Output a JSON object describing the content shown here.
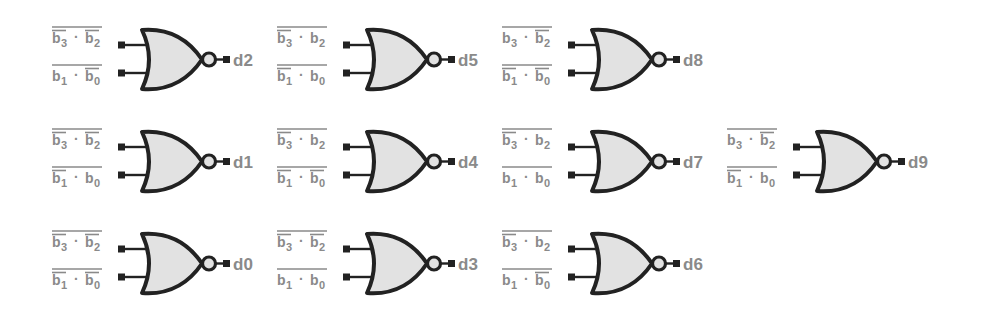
{
  "diagram": {
    "title": "",
    "colors": {
      "label": "#8a8a8a",
      "gate_fill": "#e2e2e2",
      "gate_stroke": "#222222",
      "background": "#ffffff"
    },
    "gates": [
      {
        "output": "d2",
        "row": 0,
        "col": 0,
        "x": 118,
        "y": 18,
        "term1": {
          "left": "b3",
          "left_sub": "3",
          "right": "b2",
          "right_sub": "2",
          "left_bar": true,
          "right_bar": true,
          "outer_bar": true
        },
        "term2": {
          "left": "b1",
          "left_sub": "1",
          "right": "b0",
          "right_sub": "0",
          "left_bar": false,
          "right_bar": true,
          "outer_bar": true
        }
      },
      {
        "output": "d5",
        "row": 0,
        "col": 1,
        "x": 343,
        "y": 18,
        "term1": {
          "left": "b3",
          "left_sub": "3",
          "right": "b2",
          "right_sub": "2",
          "left_bar": true,
          "right_bar": false,
          "outer_bar": true
        },
        "term2": {
          "left": "b1",
          "left_sub": "1",
          "right": "b0",
          "right_sub": "0",
          "left_bar": true,
          "right_bar": false,
          "outer_bar": true
        }
      },
      {
        "output": "d8",
        "row": 0,
        "col": 2,
        "x": 568,
        "y": 18,
        "term1": {
          "left": "b3",
          "left_sub": "3",
          "right": "b2",
          "right_sub": "2",
          "left_bar": false,
          "right_bar": true,
          "outer_bar": true
        },
        "term2": {
          "left": "b1",
          "left_sub": "1",
          "right": "b0",
          "right_sub": "0",
          "left_bar": true,
          "right_bar": true,
          "outer_bar": true
        }
      },
      {
        "output": "d1",
        "row": 1,
        "col": 0,
        "x": 118,
        "y": 120,
        "term1": {
          "left": "b3",
          "left_sub": "3",
          "right": "b2",
          "right_sub": "2",
          "left_bar": true,
          "right_bar": true,
          "outer_bar": true
        },
        "term2": {
          "left": "b1",
          "left_sub": "1",
          "right": "b0",
          "right_sub": "0",
          "left_bar": true,
          "right_bar": false,
          "outer_bar": true
        }
      },
      {
        "output": "d4",
        "row": 1,
        "col": 1,
        "x": 343,
        "y": 120,
        "term1": {
          "left": "b3",
          "left_sub": "3",
          "right": "b2",
          "right_sub": "2",
          "left_bar": true,
          "right_bar": false,
          "outer_bar": true
        },
        "term2": {
          "left": "b1",
          "left_sub": "1",
          "right": "b0",
          "right_sub": "0",
          "left_bar": true,
          "right_bar": true,
          "outer_bar": true
        }
      },
      {
        "output": "d7",
        "row": 1,
        "col": 2,
        "x": 568,
        "y": 120,
        "term1": {
          "left": "b3",
          "left_sub": "3",
          "right": "b2",
          "right_sub": "2",
          "left_bar": true,
          "right_bar": false,
          "outer_bar": true
        },
        "term2": {
          "left": "b1",
          "left_sub": "1",
          "right": "b0",
          "right_sub": "0",
          "left_bar": false,
          "right_bar": false,
          "outer_bar": true
        }
      },
      {
        "output": "d9",
        "row": 1,
        "col": 3,
        "x": 793,
        "y": 120,
        "term1": {
          "left": "b3",
          "left_sub": "3",
          "right": "b2",
          "right_sub": "2",
          "left_bar": false,
          "right_bar": true,
          "outer_bar": true
        },
        "term2": {
          "left": "b1",
          "left_sub": "1",
          "right": "b0",
          "right_sub": "0",
          "left_bar": true,
          "right_bar": false,
          "outer_bar": true
        }
      },
      {
        "output": "d0",
        "row": 2,
        "col": 0,
        "x": 118,
        "y": 222,
        "term1": {
          "left": "b3",
          "left_sub": "3",
          "right": "b2",
          "right_sub": "2",
          "left_bar": true,
          "right_bar": true,
          "outer_bar": true
        },
        "term2": {
          "left": "b1",
          "left_sub": "1",
          "right": "b0",
          "right_sub": "0",
          "left_bar": true,
          "right_bar": true,
          "outer_bar": true
        }
      },
      {
        "output": "d3",
        "row": 2,
        "col": 1,
        "x": 343,
        "y": 222,
        "term1": {
          "left": "b3",
          "left_sub": "3",
          "right": "b2",
          "right_sub": "2",
          "left_bar": true,
          "right_bar": true,
          "outer_bar": true
        },
        "term2": {
          "left": "b1",
          "left_sub": "1",
          "right": "b0",
          "right_sub": "0",
          "left_bar": false,
          "right_bar": false,
          "outer_bar": true
        }
      },
      {
        "output": "d6",
        "row": 2,
        "col": 2,
        "x": 568,
        "y": 222,
        "term1": {
          "left": "b3",
          "left_sub": "3",
          "right": "b2",
          "right_sub": "2",
          "left_bar": true,
          "right_bar": false,
          "outer_bar": true
        },
        "term2": {
          "left": "b1",
          "left_sub": "1",
          "right": "b0",
          "right_sub": "0",
          "left_bar": false,
          "right_bar": true,
          "outer_bar": true
        }
      }
    ]
  }
}
